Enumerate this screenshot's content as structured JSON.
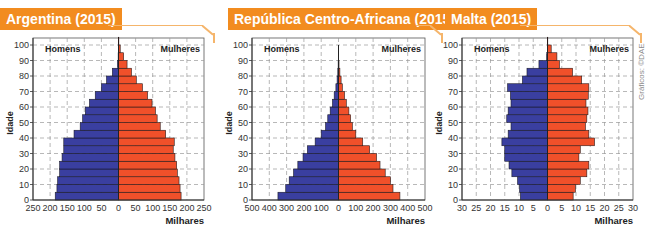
{
  "chart_data": [
    {
      "type": "bar",
      "orientation": "horizontal-pyramid",
      "title": "Argentina (2015)",
      "ylabel": "Idade",
      "xlabel": "Milhares",
      "left_label": "Homens",
      "right_label": "Mulheres",
      "age_groups": [
        "0-4",
        "5-9",
        "10-14",
        "15-19",
        "20-24",
        "25-29",
        "30-34",
        "35-39",
        "40-44",
        "45-49",
        "50-54",
        "55-59",
        "60-64",
        "65-69",
        "70-74",
        "75-79",
        "80-84",
        "85-89",
        "90-94",
        "95-99",
        "100+"
      ],
      "y_ticks": [
        0,
        10,
        20,
        30,
        40,
        50,
        60,
        70,
        80,
        90,
        100
      ],
      "x_ticks": [
        250,
        200,
        150,
        100,
        50,
        0,
        50,
        100,
        150,
        200,
        250
      ],
      "xlim": [
        -250,
        250
      ],
      "ylim": [
        0,
        100
      ],
      "grid": true,
      "series": [
        {
          "name": "Homens",
          "color": "#3a3fa0",
          "values": [
            185,
            180,
            178,
            172,
            172,
            165,
            160,
            160,
            130,
            112,
            105,
            97,
            85,
            68,
            50,
            35,
            18,
            3,
            1,
            0.5,
            0
          ]
        },
        {
          "name": "Mulheres",
          "color": "#f0502a",
          "values": [
            183,
            180,
            177,
            172,
            170,
            165,
            160,
            163,
            138,
            122,
            113,
            108,
            98,
            85,
            70,
            52,
            38,
            25,
            15,
            5,
            1
          ]
        }
      ]
    },
    {
      "type": "bar",
      "orientation": "horizontal-pyramid",
      "title": "República Centro-Africana (2015)",
      "ylabel": "Idade",
      "xlabel": "Milhares",
      "left_label": "Homens",
      "right_label": "Mulheres",
      "age_groups": [
        "0-4",
        "5-9",
        "10-14",
        "15-19",
        "20-24",
        "25-29",
        "30-34",
        "35-39",
        "40-44",
        "45-49",
        "50-54",
        "55-59",
        "60-64",
        "65-69",
        "70-74",
        "75-79",
        "80-84",
        "85-89",
        "90-94",
        "95-99",
        "100+"
      ],
      "y_ticks": [
        0,
        10,
        20,
        30,
        40,
        50,
        60,
        70,
        80,
        90,
        100
      ],
      "x_ticks": [
        500,
        400,
        300,
        200,
        100,
        0,
        100,
        200,
        300,
        400,
        500
      ],
      "xlim": [
        -500,
        500
      ],
      "ylim": [
        0,
        100
      ],
      "grid": true,
      "series": [
        {
          "name": "Homens",
          "color": "#3a3fa0",
          "values": [
            350,
            305,
            285,
            260,
            235,
            205,
            180,
            135,
            100,
            75,
            62,
            48,
            35,
            25,
            15,
            8,
            4,
            2,
            1,
            0,
            0
          ]
        },
        {
          "name": "Mulheres",
          "color": "#f0502a",
          "values": [
            355,
            315,
            300,
            270,
            240,
            220,
            180,
            140,
            100,
            80,
            70,
            60,
            45,
            35,
            22,
            15,
            8,
            3,
            1,
            0,
            0
          ]
        }
      ]
    },
    {
      "type": "bar",
      "orientation": "horizontal-pyramid",
      "title": "Malta (2015)",
      "ylabel": "Idade",
      "xlabel": "Milhares",
      "left_label": "Homens",
      "right_label": "Mulheres",
      "age_groups": [
        "0-4",
        "5-9",
        "10-14",
        "15-19",
        "20-24",
        "25-29",
        "30-34",
        "35-39",
        "40-44",
        "45-49",
        "50-54",
        "55-59",
        "60-64",
        "65-69",
        "70-74",
        "75-79",
        "80-84",
        "85-89",
        "90-94",
        "95-99",
        "100+"
      ],
      "y_ticks": [
        0,
        10,
        20,
        30,
        40,
        50,
        60,
        70,
        80,
        90,
        100
      ],
      "x_ticks": [
        30,
        25,
        20,
        15,
        10,
        5,
        0,
        5,
        10,
        15,
        20,
        25,
        30
      ],
      "xlim": [
        -30,
        30
      ],
      "ylim": [
        0,
        100
      ],
      "grid": true,
      "series": [
        {
          "name": "Homens",
          "color": "#3a3fa0",
          "values": [
            9.5,
            9.8,
            10.5,
            12.5,
            13.5,
            15,
            15,
            16,
            13.8,
            12.8,
            14.3,
            13.8,
            12.8,
            13,
            14,
            8.8,
            7.2,
            3,
            0.3,
            0,
            0
          ]
        },
        {
          "name": "Mulheres",
          "color": "#f0502a",
          "values": [
            9,
            9.8,
            11.5,
            13.8,
            14.5,
            11,
            11.5,
            16.5,
            14.5,
            13.3,
            13.8,
            14.2,
            13.5,
            14.3,
            14.5,
            12,
            8.8,
            4.2,
            3.3,
            1.3,
            0.1
          ]
        }
      ]
    }
  ],
  "panels": [
    {
      "title": "Argentina (2015)"
    },
    {
      "title": "República Centro-Africana (2015)"
    },
    {
      "title": "Malta (2015)"
    }
  ],
  "credit": "Gráficos: ©DAE",
  "colors": {
    "accent": "#f28c1f",
    "men": "#3a3fa0",
    "women": "#f0502a",
    "frame": "#f5b56b"
  }
}
